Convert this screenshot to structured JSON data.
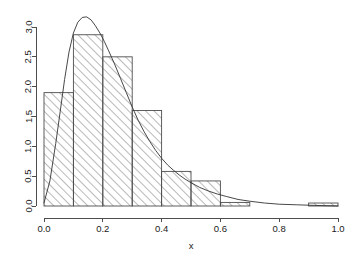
{
  "chart_data": {
    "type": "bar",
    "title": "",
    "subtitle": "",
    "xlabel": "x",
    "ylabel": "",
    "xlim": [
      0,
      1
    ],
    "ylim": [
      0,
      3.2
    ],
    "grid": false,
    "legend": null,
    "bin_width": 0.1,
    "categories": [
      "0.0-0.1",
      "0.1-0.2",
      "0.2-0.3",
      "0.3-0.4",
      "0.4-0.5",
      "0.5-0.6",
      "0.6-0.7",
      "0.7-0.8",
      "0.8-0.9",
      "0.9-1.0"
    ],
    "bin_edges": [
      0.0,
      0.1,
      0.2,
      0.3,
      0.4,
      0.5,
      0.6,
      0.7,
      0.8,
      0.9,
      1.0
    ],
    "values": [
      1.9,
      2.87,
      2.5,
      1.6,
      0.58,
      0.42,
      0.06,
      0.0,
      0.0,
      0.05
    ],
    "xticks": [
      0.0,
      0.2,
      0.4,
      0.6,
      0.8,
      1.0
    ],
    "xtick_labels": [
      "0.0",
      "0.2",
      "0.4",
      "0.6",
      "0.8",
      "1.0"
    ],
    "yticks": [
      0.0,
      0.5,
      1.0,
      1.5,
      2.0,
      2.5,
      3.0
    ],
    "ytick_labels": [
      "0.0",
      "0.5",
      "1.0",
      "1.5",
      "2.0",
      "2.5",
      "3.0"
    ],
    "overlay": {
      "name": "density-curve",
      "type": "line",
      "x": [
        0.0,
        0.02,
        0.04,
        0.055,
        0.07,
        0.085,
        0.1,
        0.115,
        0.13,
        0.145,
        0.16,
        0.175,
        0.19,
        0.205,
        0.22,
        0.24,
        0.26,
        0.28,
        0.3,
        0.32,
        0.34,
        0.36,
        0.38,
        0.4,
        0.42,
        0.44,
        0.46,
        0.48,
        0.5,
        0.53,
        0.56,
        0.59,
        0.62,
        0.66,
        0.7,
        0.75,
        0.8,
        0.86,
        0.92,
        1.0
      ],
      "y": [
        0.05,
        0.42,
        1.05,
        1.58,
        2.12,
        2.58,
        2.9,
        3.08,
        3.16,
        3.17,
        3.12,
        3.02,
        2.9,
        2.76,
        2.6,
        2.38,
        2.14,
        1.9,
        1.66,
        1.44,
        1.25,
        1.08,
        0.93,
        0.8,
        0.69,
        0.6,
        0.52,
        0.45,
        0.39,
        0.31,
        0.25,
        0.2,
        0.16,
        0.11,
        0.08,
        0.05,
        0.03,
        0.02,
        0.01,
        0.0
      ]
    },
    "style": {
      "bar_fill": "hatched-45",
      "bar_border_color": "#4d4d4d",
      "curve_color": "#333333",
      "background": "#ffffff",
      "text_color": "#1a1a1a"
    }
  },
  "axes": {
    "x_axis_title": "x",
    "y_axis_title": ""
  }
}
